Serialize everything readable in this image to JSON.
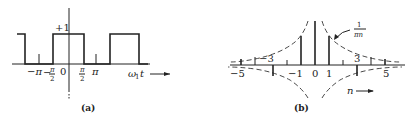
{
  "panel_a": {
    "caption": "(a)",
    "amplitude_label": "+1",
    "tick_labels": {
      "minus_pi": "−π",
      "minus_half_pi_num": "π",
      "minus_half_pi_den": "2",
      "minus_sign": "−",
      "zero": "0",
      "half_pi_num": "π",
      "half_pi_den": "2",
      "pi": "π"
    },
    "axis_label": "ω",
    "axis_label_sub": "1",
    "axis_label_var": "t",
    "description": "Square wave of amplitude +1, high on (−π/2, π/2), period 2π"
  },
  "panel_b": {
    "caption": "(b)",
    "envelope_label_num": "1",
    "envelope_label_den": "πn",
    "tick_labels": {
      "n_minus5": "−5",
      "n_minus3": "−3",
      "n_minus1": "−1",
      "n_0": "0",
      "n_1": "1",
      "n_3": "3",
      "n_5": "5"
    },
    "axis_label": "n",
    "description": "Line spectrum of Fourier coefficients with ±1/(πn) envelope"
  }
}
